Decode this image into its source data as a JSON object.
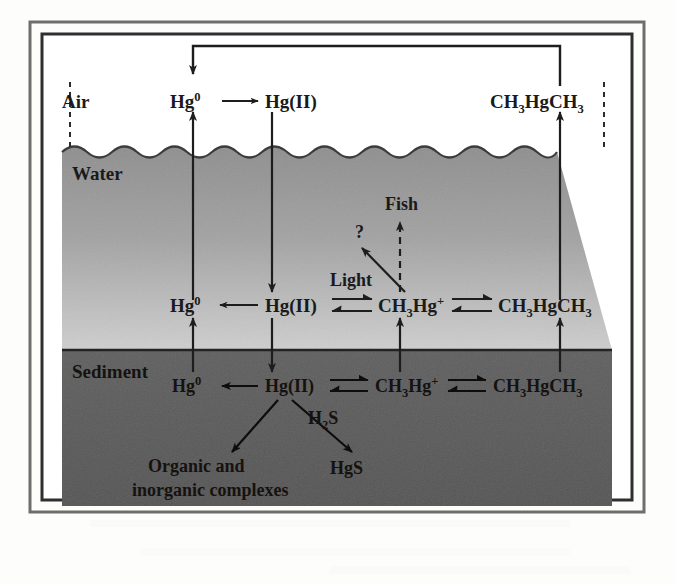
{
  "figure": {
    "zones": [
      {
        "id": "air",
        "label": "Air",
        "fill": "#ffffff"
      },
      {
        "id": "water",
        "label": "Water",
        "fill": "#9a9a9a"
      },
      {
        "id": "sediment",
        "label": "Sediment",
        "fill": "#5d5d5d"
      }
    ],
    "frame": {
      "outer_color": "#4a4a4a",
      "inner_color": "#2b2b2b",
      "background": "#ffffff"
    },
    "rows": {
      "air": {
        "species": [
          {
            "id": "air-hg0",
            "formula": "Hg",
            "sup": "0",
            "sub": "",
            "text": "Hg0"
          },
          {
            "id": "air-hg2",
            "formula": "Hg(II)",
            "sup": "",
            "sub": "",
            "text": "Hg(II)"
          },
          {
            "id": "air-dmhg",
            "formula": "CH3HgCH3",
            "sup": "",
            "sub": "3",
            "text": "CH3HgCH3"
          }
        ],
        "reactions": [
          {
            "id": "air-hg0-to-hg2",
            "type": "single-arrow",
            "from": "air-hg0",
            "to": "air-hg2"
          }
        ]
      },
      "water": {
        "species": [
          {
            "id": "water-hg0",
            "formula": "Hg",
            "sup": "0",
            "text": "Hg0"
          },
          {
            "id": "water-hg2",
            "formula": "Hg(II)",
            "text": "Hg(II)"
          },
          {
            "id": "water-mmhg",
            "formula": "CH3Hg+",
            "text": "CH3Hg+"
          },
          {
            "id": "water-dmhg",
            "formula": "CH3HgCH3",
            "text": "CH3HgCH3"
          }
        ],
        "reactions": [
          {
            "id": "water-hg2-to-hg0",
            "type": "single-arrow-left",
            "from": "water-hg2",
            "to": "water-hg0"
          },
          {
            "id": "water-hg2-mmhg",
            "type": "equilibrium",
            "from": "water-hg2",
            "to": "water-mmhg"
          },
          {
            "id": "water-mmhg-dmhg",
            "type": "equilibrium",
            "from": "water-mmhg",
            "to": "water-dmhg"
          }
        ]
      },
      "sediment": {
        "species": [
          {
            "id": "sed-hg0",
            "formula": "Hg",
            "sup": "0",
            "text": "Hg0"
          },
          {
            "id": "sed-hg2",
            "formula": "Hg(II)",
            "text": "Hg(II)"
          },
          {
            "id": "sed-mmhg",
            "formula": "CH3Hg+",
            "text": "CH3Hg+"
          },
          {
            "id": "sed-dmhg",
            "formula": "CH3HgCH3",
            "text": "CH3HgCH3"
          }
        ],
        "reactions": [
          {
            "id": "sed-hg2-to-hg0",
            "type": "single-arrow-left",
            "from": "sed-hg2",
            "to": "sed-hg0"
          },
          {
            "id": "sed-hg2-mmhg",
            "type": "equilibrium",
            "from": "sed-hg2",
            "to": "sed-mmhg"
          },
          {
            "id": "sed-mmhg-dmhg",
            "type": "equilibrium",
            "from": "sed-mmhg",
            "to": "sed-dmhg"
          }
        ]
      }
    },
    "annotations": [
      {
        "id": "fish",
        "label": "Fish",
        "arrow": "dashed-up",
        "source": "water-mmhg"
      },
      {
        "id": "question",
        "label": "?"
      },
      {
        "id": "light",
        "label": "Light",
        "arrow": "diagonal-up-left",
        "target": "question"
      },
      {
        "id": "h2s",
        "label": "H2S",
        "sub": "2"
      },
      {
        "id": "hgs",
        "label": "HgS"
      },
      {
        "id": "complexes-line1",
        "label": "Organic and"
      },
      {
        "id": "complexes-line2",
        "label": "inorganic complexes"
      }
    ],
    "transfers": [
      {
        "id": "air-recycle-bracket",
        "label": "",
        "from": "air-dmhg",
        "to": "air-hg0",
        "style": "bracket-down-arrow"
      },
      {
        "id": "evasion-hg0",
        "from": "water-hg0",
        "to": "air-hg0",
        "style": "arrow-up"
      },
      {
        "id": "deposition-hg2",
        "from": "air-hg2",
        "to": "water-hg2",
        "style": "arrow-down"
      },
      {
        "id": "evasion-dmhg",
        "from": "water-dmhg",
        "to": "air-dmhg",
        "style": "arrow-up"
      },
      {
        "id": "sed-to-water-hg0",
        "from": "sed-hg0",
        "to": "water-hg0",
        "style": "arrow-up"
      },
      {
        "id": "water-to-sed-hg2",
        "from": "water-hg2",
        "to": "sed-hg2",
        "style": "arrow-down"
      },
      {
        "id": "sed-to-water-mmhg",
        "from": "sed-mmhg",
        "to": "water-mmhg",
        "style": "arrow-up"
      },
      {
        "id": "sed-to-water-dmhg",
        "from": "sed-dmhg",
        "to": "water-dmhg",
        "style": "arrow-up"
      },
      {
        "id": "hg2-to-complexes",
        "from": "sed-hg2",
        "to": "complexes",
        "style": "diagonal-arrow"
      },
      {
        "id": "hg2-to-hgs",
        "from": "sed-hg2",
        "to": "hgs",
        "style": "diagonal-arrow"
      }
    ]
  },
  "text": {
    "air": "Air",
    "water": "Water",
    "sediment": "Sediment",
    "hg0": "Hg",
    "hg0_sup": "0",
    "hg2": "Hg(II)",
    "mmhg_a": "CH",
    "mmhg_sub": "3",
    "mmhg_b": "Hg",
    "mmhg_sup": "+",
    "dmhg_a": "CH",
    "dmhg_sub1": "3",
    "dmhg_b": "Hg",
    "dmhg_c": "CH",
    "dmhg_sub2": "3",
    "fish": "Fish",
    "light": "Light",
    "question": "?",
    "h2s_a": "H",
    "h2s_sub": "2",
    "h2s_b": "S",
    "hgs": "HgS",
    "organic_and": "Organic and",
    "inorganic_complexes": "inorganic complexes"
  }
}
